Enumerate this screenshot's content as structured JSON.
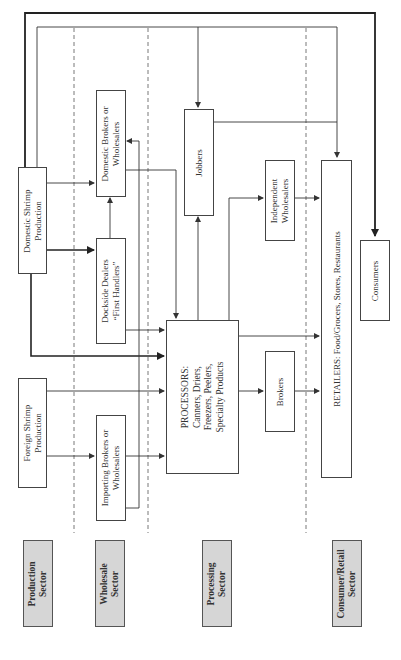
{
  "sectors": {
    "production": "Production\nSector",
    "wholesale": "Wholesale\nSector",
    "processing": "Processing\nSector",
    "consumer_retail": "Consumer/Retail\nSector"
  },
  "nodes": {
    "domestic_production": "Domestic Shrimp\nProduction",
    "foreign_production": "Foreign Shrimp\nProduction",
    "domestic_brokers": "Domestic Brokers or\nWholesalers",
    "dockside_dealers": "Dockside Dealers\n“First Handlers”",
    "importing_brokers": "Importing Brokers or\nWholesalers",
    "processors": "PROCESSORS:\nCanners, Driers,\nFreezers, Peelers,\nSpecialty Products",
    "jobbers": "Jobbers",
    "independent_wholesalers": "Independent\nWholesalers",
    "brokers": "Brokers",
    "retailers": "RETAILERS: Food/Grocers, Stores, Restaurants",
    "consumers": "Consumers"
  },
  "edges": [
    {
      "from": "domestic_production",
      "to": "consumers",
      "weight": "bold"
    },
    {
      "from": "domestic_production",
      "to": "retailers"
    },
    {
      "from": "domestic_production",
      "to": "domestic_brokers"
    },
    {
      "from": "domestic_production",
      "to": "dockside_dealers",
      "weight": "bold"
    },
    {
      "from": "domestic_production",
      "to": "processors",
      "weight": "bold"
    },
    {
      "from": "dockside_dealers",
      "to": "domestic_brokers"
    },
    {
      "from": "dockside_dealers",
      "to": "processors"
    },
    {
      "from": "domestic_brokers",
      "to": "processors"
    },
    {
      "from": "importing_brokers",
      "to": "domestic_brokers"
    },
    {
      "from": "importing_brokers",
      "to": "processors"
    },
    {
      "from": "foreign_production",
      "to": "importing_brokers"
    },
    {
      "from": "foreign_production",
      "to": "processors"
    },
    {
      "from": "processors",
      "to": "jobbers"
    },
    {
      "from": "processors",
      "to": "independent_wholesalers"
    },
    {
      "from": "processors",
      "to": "brokers"
    },
    {
      "from": "processors",
      "to": "retailers"
    },
    {
      "from": "jobbers",
      "to": "retailers"
    },
    {
      "from": "independent_wholesalers",
      "to": "retailers"
    },
    {
      "from": "brokers",
      "to": "retailers"
    }
  ]
}
